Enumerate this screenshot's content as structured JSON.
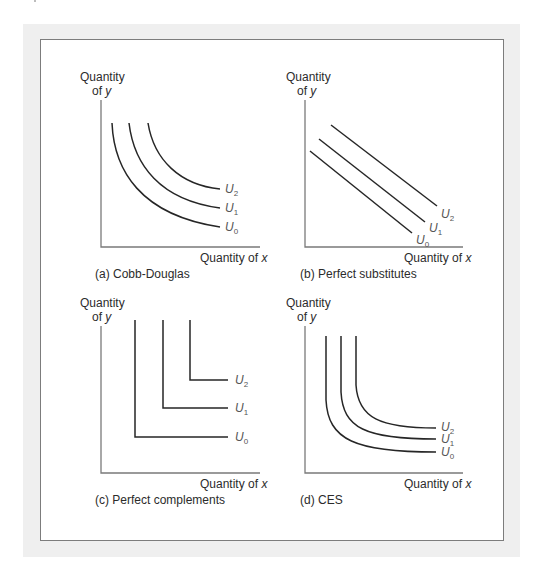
{
  "figure": {
    "panels": [
      {
        "id": "a",
        "caption": "(a) Cobb-Douglas",
        "y_label_line1": "Quantity",
        "y_label_line2_prefix": "of ",
        "y_label_var": "y",
        "x_label_prefix": "Quantity of ",
        "x_label_var": "x",
        "curves": [
          {
            "name": "U",
            "sub": "0"
          },
          {
            "name": "U",
            "sub": "1"
          },
          {
            "name": "U",
            "sub": "2"
          }
        ]
      },
      {
        "id": "b",
        "caption": "(b) Perfect substitutes",
        "y_label_line1": "Quantity",
        "y_label_line2_prefix": "of ",
        "y_label_var": "y",
        "x_label_prefix": "Quantity of ",
        "x_label_var": "x",
        "curves": [
          {
            "name": "U",
            "sub": "0"
          },
          {
            "name": "U",
            "sub": "1"
          },
          {
            "name": "U",
            "sub": "2"
          }
        ]
      },
      {
        "id": "c",
        "caption": "(c) Perfect complements",
        "y_label_line1": "Quantity",
        "y_label_line2_prefix": "of ",
        "y_label_var": "y",
        "x_label_prefix": "Quantity of ",
        "x_label_var": "x",
        "curves": [
          {
            "name": "U",
            "sub": "0"
          },
          {
            "name": "U",
            "sub": "1"
          },
          {
            "name": "U",
            "sub": "2"
          }
        ]
      },
      {
        "id": "d",
        "caption": "(d) CES",
        "y_label_line1": "Quantity",
        "y_label_line2_prefix": "of ",
        "y_label_var": "y",
        "x_label_prefix": "Quantity of ",
        "x_label_var": "x",
        "curves": [
          {
            "name": "U",
            "sub": "0"
          },
          {
            "name": "U",
            "sub": "1"
          },
          {
            "name": "U",
            "sub": "2"
          }
        ]
      }
    ]
  },
  "colors": {
    "frame_bg": "#efefef",
    "panel_border": "#7c7c7c",
    "curve": "#262626",
    "axis": "#7a7a7a",
    "label": "#555555"
  }
}
